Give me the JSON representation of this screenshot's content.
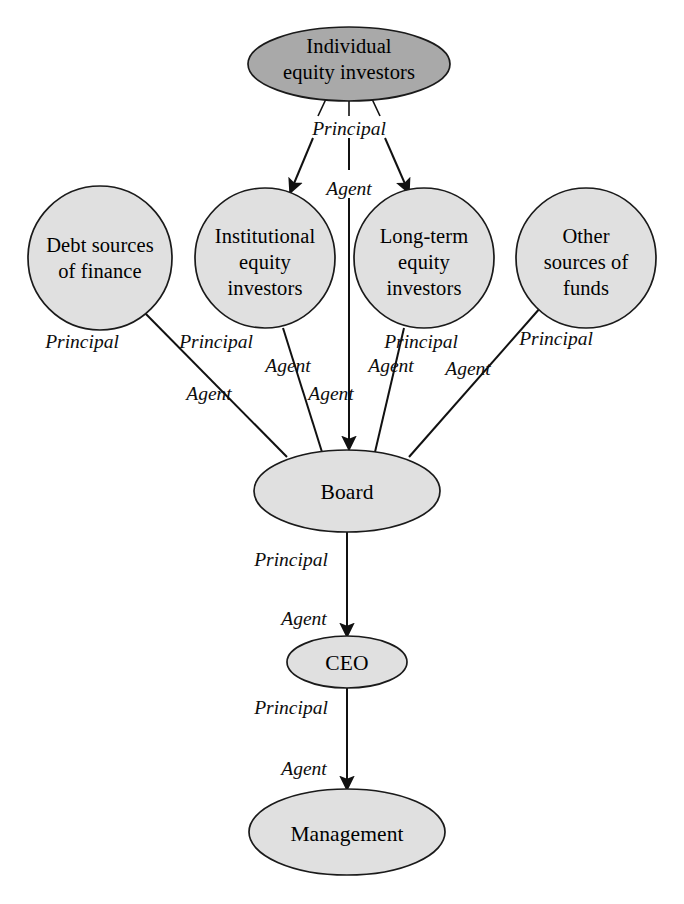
{
  "diagram": {
    "colors": {
      "top_node_fill": "#a9a9a9",
      "node_fill": "#e0e0e0",
      "stroke": "#1a1a1a",
      "text": "#000000",
      "background": "#ffffff"
    },
    "nodes": {
      "individual_equity_investors": {
        "line1": "Individual",
        "line2": "equity investors",
        "shape": "ellipse"
      },
      "debt_sources": {
        "line1": "Debt sources",
        "line2": "of finance",
        "shape": "circle"
      },
      "institutional_equity": {
        "line1": "Institutional",
        "line2": "equity",
        "line3": "investors",
        "shape": "circle"
      },
      "long_term_equity": {
        "line1": "Long-term",
        "line2": "equity",
        "line3": "investors",
        "shape": "circle"
      },
      "other_sources": {
        "line1": "Other",
        "line2": "sources of",
        "line3": "funds",
        "shape": "circle"
      },
      "board": {
        "line1": "Board",
        "shape": "ellipse"
      },
      "ceo": {
        "line1": "CEO",
        "shape": "ellipse"
      },
      "management": {
        "line1": "Management",
        "shape": "ellipse"
      }
    },
    "role_labels": {
      "principal": "Principal",
      "agent": "Agent"
    },
    "edges": [
      {
        "id": "top-to-institutional",
        "from": "individual_equity_investors",
        "to": "institutional_equity",
        "principal": "Principal",
        "agent": "Agent"
      },
      {
        "id": "top-to-longterm",
        "from": "individual_equity_investors",
        "to": "long_term_equity",
        "principal": "Principal",
        "agent": "Agent"
      },
      {
        "id": "top-to-board",
        "from": "individual_equity_investors",
        "to": "board",
        "principal": "Principal",
        "agent": "Agent"
      },
      {
        "id": "debt-to-board",
        "from": "debt_sources",
        "to": "board",
        "principal": "Principal",
        "agent": "Agent"
      },
      {
        "id": "institutional-to-board",
        "from": "institutional_equity",
        "to": "board",
        "principal": "Principal",
        "agent": "Agent"
      },
      {
        "id": "longterm-to-board",
        "from": "long_term_equity",
        "to": "board",
        "principal": "Principal",
        "agent": "Agent"
      },
      {
        "id": "other-to-board",
        "from": "other_sources",
        "to": "board",
        "principal": "Principal",
        "agent": "Agent"
      },
      {
        "id": "board-to-ceo",
        "from": "board",
        "to": "ceo",
        "principal": "Principal",
        "agent": "Agent"
      },
      {
        "id": "ceo-to-management",
        "from": "ceo",
        "to": "management",
        "principal": "Principal",
        "agent": "Agent"
      }
    ]
  }
}
